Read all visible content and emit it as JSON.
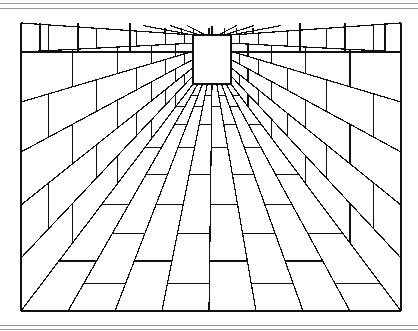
{
  "image": {
    "subject": "one-point perspective brick corridor line drawing",
    "stroke_color": "#111111",
    "background": "#ffffff",
    "rule_color": "#9a9a9a"
  },
  "rules": [
    3,
    8,
    325,
    329
  ],
  "frame": {
    "left": 21,
    "right": 401,
    "top": 23,
    "bottom": 311
  },
  "vanishing_point": {
    "x": 212,
    "y": 60
  },
  "end_window": {
    "x": 193,
    "y": 35,
    "w": 38,
    "h": 49
  },
  "floor_ray_bottom_x": [
    21,
    68,
    115,
    162,
    209,
    256,
    303,
    350,
    401
  ],
  "floor_course_depths": [
    0.08,
    0.14,
    0.22,
    0.32,
    0.45,
    0.62,
    0.82
  ],
  "wall_ray_edge_y": [
    23,
    52,
    102,
    152,
    205,
    258,
    311
  ],
  "ceiling_ray_top_x": [
    82,
    135,
    165,
    212,
    259,
    289,
    342
  ]
}
